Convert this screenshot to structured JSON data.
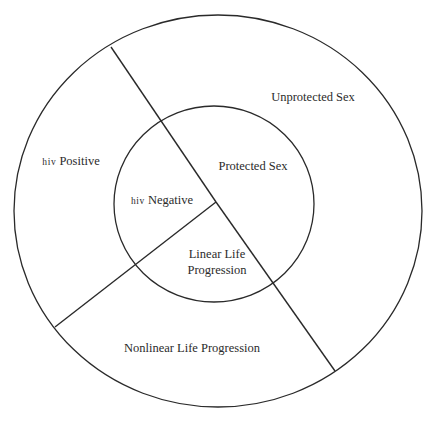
{
  "diagram": {
    "colors": {
      "background": "#ffffff",
      "stroke": "#2a2a2a",
      "text": "#2b2b2b"
    },
    "outer_circle": {
      "cx": 218,
      "cy": 211,
      "rx": 204,
      "ry": 196
    },
    "inner_circle": {
      "cx": 214,
      "cy": 204,
      "rx": 100,
      "ry": 98
    },
    "junction": {
      "x": 216,
      "y": 202
    },
    "dividers": [
      {
        "name": "divider-top-left",
        "x2": 111,
        "y2": 47
      },
      {
        "name": "divider-bottom-right",
        "x2": 335,
        "y2": 371
      },
      {
        "name": "divider-bottom-left",
        "x2": 55,
        "y2": 327
      }
    ],
    "labels": {
      "hiv_positive": {
        "prefix": "hiv",
        "text": " Positive"
      },
      "hiv_negative": {
        "prefix": "hiv",
        "text": " Negative"
      },
      "protected_sex": "Protected Sex",
      "unprotected_sex": "Unprotected Sex",
      "linear_life_line1": "Linear Life",
      "linear_life_line2": "Progression",
      "nonlinear_life": "Nonlinear Life Progression"
    }
  }
}
